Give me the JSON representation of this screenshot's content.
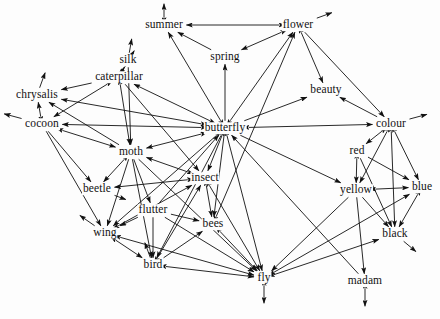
{
  "graph": {
    "type": "directed-node-link-diagram",
    "title": "Word association network",
    "background_color": "#fdfdfd",
    "edge_color": "#111111",
    "label_color": "#111111",
    "width": 440,
    "height": 319,
    "nodes": [
      {
        "id": "summer",
        "label": "summer",
        "x": 164,
        "y": 25
      },
      {
        "id": "flower",
        "label": "flower",
        "x": 298,
        "y": 25
      },
      {
        "id": "spring",
        "label": "spring",
        "x": 225,
        "y": 57
      },
      {
        "id": "silk",
        "label": "silk",
        "x": 128,
        "y": 60
      },
      {
        "id": "caterpillar",
        "label": "caterpillar",
        "x": 119,
        "y": 77
      },
      {
        "id": "beauty",
        "label": "beauty",
        "x": 326,
        "y": 90
      },
      {
        "id": "chrysalis",
        "label": "chrysalis",
        "x": 37,
        "y": 95
      },
      {
        "id": "cocoon",
        "label": "cocoon",
        "x": 42,
        "y": 124
      },
      {
        "id": "butterfly",
        "label": "butterfly",
        "x": 225,
        "y": 128
      },
      {
        "id": "colour",
        "label": "colour",
        "x": 391,
        "y": 124
      },
      {
        "id": "moth",
        "label": "moth",
        "x": 131,
        "y": 152
      },
      {
        "id": "red",
        "label": "red",
        "x": 357,
        "y": 151
      },
      {
        "id": "insect",
        "label": "insect",
        "x": 205,
        "y": 178
      },
      {
        "id": "beetle",
        "label": "beetle",
        "x": 97,
        "y": 189
      },
      {
        "id": "yellow",
        "label": "yellow",
        "x": 356,
        "y": 190
      },
      {
        "id": "blue",
        "label": "blue",
        "x": 422,
        "y": 187
      },
      {
        "id": "flutter",
        "label": "flutter",
        "x": 153,
        "y": 210
      },
      {
        "id": "bees",
        "label": "bees",
        "x": 213,
        "y": 224
      },
      {
        "id": "wing",
        "label": "wing",
        "x": 105,
        "y": 233
      },
      {
        "id": "black",
        "label": "black",
        "x": 395,
        "y": 234
      },
      {
        "id": "bird",
        "label": "bird",
        "x": 153,
        "y": 265
      },
      {
        "id": "fly",
        "label": "fly",
        "x": 264,
        "y": 278
      },
      {
        "id": "madam",
        "label": "madam",
        "x": 365,
        "y": 281
      }
    ],
    "edges": [
      {
        "from": "flower",
        "to": "summer"
      },
      {
        "from": "flower",
        "to": "spring"
      },
      {
        "from": "flower",
        "to": "beauty"
      },
      {
        "from": "flower",
        "to": "colour"
      },
      {
        "from": "butterfly",
        "to": "summer"
      },
      {
        "from": "butterfly",
        "to": "flower"
      },
      {
        "from": "butterfly",
        "to": "spring"
      },
      {
        "from": "butterfly",
        "to": "caterpillar"
      },
      {
        "from": "butterfly",
        "to": "cocoon"
      },
      {
        "from": "butterfly",
        "to": "chrysalis"
      },
      {
        "from": "butterfly",
        "to": "moth"
      },
      {
        "from": "butterfly",
        "to": "colour"
      },
      {
        "from": "butterfly",
        "to": "beauty"
      },
      {
        "from": "butterfly",
        "to": "insect"
      },
      {
        "from": "butterfly",
        "to": "wing"
      },
      {
        "from": "butterfly",
        "to": "fly"
      },
      {
        "from": "butterfly",
        "to": "yellow"
      },
      {
        "from": "insect",
        "to": "butterfly"
      },
      {
        "from": "insect",
        "to": "bees"
      },
      {
        "from": "insect",
        "to": "fly"
      },
      {
        "from": "insect",
        "to": "beetle"
      },
      {
        "from": "insect",
        "to": "moth"
      },
      {
        "from": "caterpillar",
        "to": "silk"
      },
      {
        "from": "caterpillar",
        "to": "chrysalis"
      },
      {
        "from": "caterpillar",
        "to": "butterfly"
      },
      {
        "from": "caterpillar",
        "to": "moth"
      },
      {
        "from": "caterpillar",
        "to": "cocoon"
      },
      {
        "from": "cocoon",
        "to": "chrysalis"
      },
      {
        "from": "cocoon",
        "to": "caterpillar"
      },
      {
        "from": "cocoon",
        "to": "moth"
      },
      {
        "from": "cocoon",
        "to": "beetle"
      },
      {
        "from": "cocoon",
        "to": "butterfly"
      },
      {
        "from": "cocoon",
        "to": "wing"
      },
      {
        "from": "chrysalis",
        "to": "cocoon"
      },
      {
        "from": "chrysalis",
        "to": "butterfly"
      },
      {
        "from": "moth",
        "to": "butterfly"
      },
      {
        "from": "moth",
        "to": "caterpillar"
      },
      {
        "from": "moth",
        "to": "insect"
      },
      {
        "from": "moth",
        "to": "flutter"
      },
      {
        "from": "moth",
        "to": "wing"
      },
      {
        "from": "moth",
        "to": "bird"
      },
      {
        "from": "moth",
        "to": "fly"
      },
      {
        "from": "moth",
        "to": "beetle"
      },
      {
        "from": "beetle",
        "to": "insect"
      },
      {
        "from": "flutter",
        "to": "wing"
      },
      {
        "from": "flutter",
        "to": "bird"
      },
      {
        "from": "flutter",
        "to": "butterfly"
      },
      {
        "from": "flutter",
        "to": "fly"
      },
      {
        "from": "wing",
        "to": "bird"
      },
      {
        "from": "wing",
        "to": "fly"
      },
      {
        "from": "wing",
        "to": "butterfly"
      },
      {
        "from": "bird",
        "to": "fly"
      },
      {
        "from": "bird",
        "to": "wing"
      },
      {
        "from": "bees",
        "to": "fly"
      },
      {
        "from": "bees",
        "to": "insect"
      },
      {
        "from": "bees",
        "to": "flower"
      },
      {
        "from": "fly",
        "to": "bird"
      },
      {
        "from": "fly",
        "to": "bees"
      },
      {
        "from": "fly",
        "to": "butterfly"
      },
      {
        "from": "fly",
        "to": "insect"
      },
      {
        "from": "fly",
        "to": "blue"
      },
      {
        "from": "fly",
        "to": "black"
      },
      {
        "from": "colour",
        "to": "red"
      },
      {
        "from": "colour",
        "to": "yellow"
      },
      {
        "from": "colour",
        "to": "blue"
      },
      {
        "from": "colour",
        "to": "black"
      },
      {
        "from": "colour",
        "to": "beauty"
      },
      {
        "from": "red",
        "to": "colour"
      },
      {
        "from": "red",
        "to": "yellow"
      },
      {
        "from": "red",
        "to": "blue"
      },
      {
        "from": "red",
        "to": "black"
      },
      {
        "from": "yellow",
        "to": "colour"
      },
      {
        "from": "yellow",
        "to": "red"
      },
      {
        "from": "yellow",
        "to": "blue"
      },
      {
        "from": "yellow",
        "to": "black"
      },
      {
        "from": "blue",
        "to": "colour"
      },
      {
        "from": "blue",
        "to": "yellow"
      },
      {
        "from": "blue",
        "to": "black"
      },
      {
        "from": "black",
        "to": "blue"
      },
      {
        "from": "black",
        "to": "colour"
      },
      {
        "from": "beauty",
        "to": "flower"
      },
      {
        "from": "spring",
        "to": "summer"
      },
      {
        "from": "spring",
        "to": "flower"
      },
      {
        "from": "summer",
        "to": "flower"
      },
      {
        "from": "silk",
        "to": "caterpillar"
      },
      {
        "from": "madam",
        "to": "butterfly"
      },
      {
        "from": "yellow",
        "to": "madam"
      },
      {
        "from": "butterfly",
        "to": "bees"
      },
      {
        "from": "flower",
        "to": "bees"
      },
      {
        "from": "flower",
        "to": "butterfly"
      },
      {
        "from": "colour",
        "to": "butterfly"
      },
      {
        "from": "bird",
        "to": "insect"
      },
      {
        "from": "beetle",
        "to": "moth"
      },
      {
        "from": "fly",
        "to": "wing"
      },
      {
        "from": "wing",
        "to": "insect"
      },
      {
        "from": "bees",
        "to": "butterfly"
      },
      {
        "from": "moth",
        "to": "cocoon"
      },
      {
        "from": "moth",
        "to": "chrysalis"
      },
      {
        "from": "insect",
        "to": "wing"
      },
      {
        "from": "black",
        "to": "fly"
      },
      {
        "from": "blue",
        "to": "fly"
      },
      {
        "from": "yellow",
        "to": "fly"
      },
      {
        "from": "bird",
        "to": "bees"
      },
      {
        "from": "flutter",
        "to": "bees"
      },
      {
        "from": "insect",
        "to": "bird"
      },
      {
        "from": "caterpillar",
        "to": "insect"
      },
      {
        "from": "butterfly",
        "to": "bird"
      },
      {
        "from": "silk",
        "to": "moth"
      },
      {
        "from": "summer",
        "to": "butterfly"
      }
    ],
    "stub_edges": [
      {
        "node": "summer",
        "angle": 270,
        "length": 14,
        "double": true
      },
      {
        "node": "flower",
        "angle": 340,
        "length": 16,
        "double": false
      },
      {
        "node": "silk",
        "angle": 280,
        "length": 14,
        "double": false
      },
      {
        "node": "caterpillar",
        "angle": 300,
        "length": 22,
        "double": false
      },
      {
        "node": "chrysalis",
        "angle": 290,
        "length": 16,
        "double": false
      },
      {
        "node": "cocoon",
        "angle": 195,
        "length": 18,
        "double": false
      },
      {
        "node": "colour",
        "angle": 345,
        "length": 18,
        "double": false
      },
      {
        "node": "wing",
        "angle": 215,
        "length": 18,
        "double": false
      },
      {
        "node": "bird",
        "angle": 250,
        "length": 16,
        "double": false
      },
      {
        "node": "fly",
        "angle": 90,
        "length": 18,
        "double": true
      },
      {
        "node": "madam",
        "angle": 90,
        "length": 18,
        "double": true
      },
      {
        "node": "black",
        "angle": 40,
        "length": 16,
        "double": false
      },
      {
        "node": "beetle",
        "angle": 20,
        "length": 12,
        "double": false
      }
    ]
  }
}
